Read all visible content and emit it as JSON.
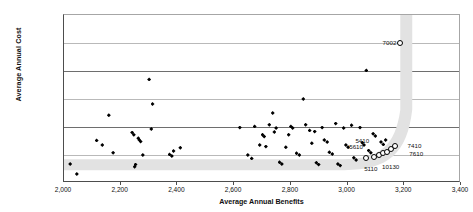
{
  "chart_data": {
    "type": "scatter",
    "title": "",
    "xlabel": "Average Annual Benefits",
    "ylabel": "Average Annual Cost",
    "xlim": [
      2000,
      3400
    ],
    "ylim": [
      60000000,
      660000000
    ],
    "grid": true,
    "legend": null,
    "xticks": [
      "2,000",
      "2,200",
      "2,400",
      "2,600",
      "2,800",
      "3,000",
      "3,200",
      "3,400"
    ],
    "xtick_values": [
      2000,
      2200,
      2400,
      2600,
      2800,
      3000,
      3200,
      3400
    ],
    "yticks": [
      "$60,000,000",
      "$160,000,000",
      "$260,000,000",
      "$360,000,000",
      "$460,000,000",
      "$560,000,000",
      "$660,000,000"
    ],
    "ytick_values": [
      60000000,
      160000000,
      260000000,
      360000000,
      460000000,
      560000000,
      660000000
    ],
    "series": [
      {
        "name": "alternatives",
        "marker": "filled-diamond",
        "color": "#000000",
        "points": [
          {
            "x": 2022,
            "y": 128000000
          },
          {
            "x": 2045,
            "y": 92000000
          },
          {
            "x": 2115,
            "y": 212000000
          },
          {
            "x": 2135,
            "y": 196000000
          },
          {
            "x": 2158,
            "y": 302000000
          },
          {
            "x": 2173,
            "y": 168000000
          },
          {
            "x": 2240,
            "y": 240000000
          },
          {
            "x": 2246,
            "y": 232000000
          },
          {
            "x": 2249,
            "y": 118000000
          },
          {
            "x": 2252,
            "y": 126000000
          },
          {
            "x": 2262,
            "y": 220000000
          },
          {
            "x": 2266,
            "y": 214000000
          },
          {
            "x": 2270,
            "y": 208000000
          },
          {
            "x": 2278,
            "y": 160000000
          },
          {
            "x": 2300,
            "y": 430000000
          },
          {
            "x": 2308,
            "y": 253000000
          },
          {
            "x": 2312,
            "y": 342000000
          },
          {
            "x": 2372,
            "y": 162000000
          },
          {
            "x": 2380,
            "y": 156000000
          },
          {
            "x": 2386,
            "y": 174000000
          },
          {
            "x": 2410,
            "y": 186000000
          },
          {
            "x": 2620,
            "y": 258000000
          },
          {
            "x": 2648,
            "y": 160000000
          },
          {
            "x": 2662,
            "y": 148000000
          },
          {
            "x": 2672,
            "y": 262000000
          },
          {
            "x": 2690,
            "y": 196000000
          },
          {
            "x": 2700,
            "y": 232000000
          },
          {
            "x": 2706,
            "y": 226000000
          },
          {
            "x": 2712,
            "y": 190000000
          },
          {
            "x": 2724,
            "y": 268000000
          },
          {
            "x": 2736,
            "y": 310000000
          },
          {
            "x": 2742,
            "y": 242000000
          },
          {
            "x": 2748,
            "y": 256000000
          },
          {
            "x": 2760,
            "y": 134000000
          },
          {
            "x": 2768,
            "y": 128000000
          },
          {
            "x": 2782,
            "y": 188000000
          },
          {
            "x": 2792,
            "y": 232000000
          },
          {
            "x": 2800,
            "y": 262000000
          },
          {
            "x": 2806,
            "y": 256000000
          },
          {
            "x": 2820,
            "y": 166000000
          },
          {
            "x": 2830,
            "y": 160000000
          },
          {
            "x": 2844,
            "y": 360000000
          },
          {
            "x": 2852,
            "y": 268000000
          },
          {
            "x": 2866,
            "y": 248000000
          },
          {
            "x": 2874,
            "y": 202000000
          },
          {
            "x": 2884,
            "y": 244000000
          },
          {
            "x": 2890,
            "y": 132000000
          },
          {
            "x": 2898,
            "y": 126000000
          },
          {
            "x": 2910,
            "y": 258000000
          },
          {
            "x": 2918,
            "y": 214000000
          },
          {
            "x": 2928,
            "y": 206000000
          },
          {
            "x": 2936,
            "y": 170000000
          },
          {
            "x": 2946,
            "y": 164000000
          },
          {
            "x": 2958,
            "y": 272000000
          },
          {
            "x": 2966,
            "y": 128000000
          },
          {
            "x": 2974,
            "y": 122000000
          },
          {
            "x": 2986,
            "y": 256000000
          },
          {
            "x": 2994,
            "y": 196000000
          },
          {
            "x": 3002,
            "y": 188000000
          },
          {
            "x": 3014,
            "y": 266000000
          },
          {
            "x": 3022,
            "y": 150000000
          },
          {
            "x": 3030,
            "y": 142000000
          },
          {
            "x": 3044,
            "y": 258000000
          },
          {
            "x": 3052,
            "y": 204000000
          },
          {
            "x": 3058,
            "y": 196000000
          },
          {
            "x": 3066,
            "y": 462000000
          },
          {
            "x": 3074,
            "y": 176000000
          },
          {
            "x": 3082,
            "y": 168000000
          },
          {
            "x": 3090,
            "y": 236000000
          },
          {
            "x": 3098,
            "y": 228000000
          },
          {
            "x": 3106,
            "y": 160000000
          },
          {
            "x": 3118,
            "y": 206000000
          },
          {
            "x": 3126,
            "y": 198000000
          },
          {
            "x": 3134,
            "y": 214000000
          }
        ]
      },
      {
        "name": "efficient-frontier",
        "marker": "open-circle",
        "color": "#000000",
        "points": [
          {
            "x": 3066,
            "y": 148000000,
            "label": "5110"
          },
          {
            "x": 3092,
            "y": 152000000,
            "label": ""
          },
          {
            "x": 3110,
            "y": 160000000,
            "label": "10130"
          },
          {
            "x": 3124,
            "y": 166000000,
            "label": ""
          },
          {
            "x": 3140,
            "y": 172000000,
            "label": "7610"
          },
          {
            "x": 3152,
            "y": 180000000,
            "label": ""
          },
          {
            "x": 3166,
            "y": 192000000,
            "label": "7410"
          },
          {
            "x": 3186,
            "y": 560000000,
            "label": "7002"
          }
        ]
      }
    ],
    "annotations": [
      {
        "text": "7002",
        "x": 3148,
        "y": 562000000
      },
      {
        "text": "5410",
        "x": 3052,
        "y": 214000000
      },
      {
        "text": "5610",
        "x": 3030,
        "y": 192000000
      },
      {
        "text": "7410",
        "x": 3236,
        "y": 196000000
      },
      {
        "text": "7610",
        "x": 3242,
        "y": 166000000
      },
      {
        "text": "5110",
        "x": 3082,
        "y": 114000000
      },
      {
        "text": "10130",
        "x": 3152,
        "y": 120000000
      }
    ]
  }
}
